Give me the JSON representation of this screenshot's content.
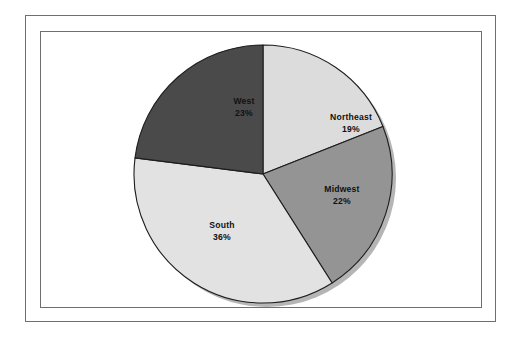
{
  "figure": {
    "background_color": "#ffffff",
    "frame_color": "#6f6f6f",
    "outline_color": "#1d1d1d",
    "shadow_color": "#b5b5b5"
  },
  "chart_data": {
    "type": "pie",
    "title": "",
    "subtitle": "",
    "xlabel": "",
    "ylabel": "",
    "grid": false,
    "legend_position": "none",
    "label_format": "name_and_percent",
    "start_angle_deg": 0,
    "direction": "clockwise",
    "categories": [
      "Northeast",
      "Midwest",
      "South",
      "West"
    ],
    "values": [
      19,
      22,
      36,
      23
    ],
    "units": "%",
    "slices": [
      {
        "name": "Northeast",
        "label": "Northeast",
        "value": 19,
        "percent_label": "19%",
        "color": "#dcdcdc",
        "start_deg": 0,
        "end_deg": 68.4,
        "label_x": 310,
        "label_y": 88
      },
      {
        "name": "Midwest",
        "label": "Midwest",
        "value": 22,
        "percent_label": "22%",
        "color": "#949494",
        "start_deg": 68.4,
        "end_deg": 147.6,
        "label_x": 301,
        "label_y": 160
      },
      {
        "name": "South",
        "label": "South",
        "value": 36,
        "percent_label": "36%",
        "color": "#e2e2e2",
        "start_deg": 147.6,
        "end_deg": 277.2,
        "label_x": 181,
        "label_y": 196
      },
      {
        "name": "West",
        "label": "West",
        "value": 23,
        "percent_label": "23%",
        "color": "#4a4a4a",
        "start_deg": 277.2,
        "end_deg": 360,
        "label_x": 203,
        "label_y": 72
      }
    ],
    "geometry": {
      "center_x": 222,
      "center_y": 142,
      "radius": 129
    }
  }
}
